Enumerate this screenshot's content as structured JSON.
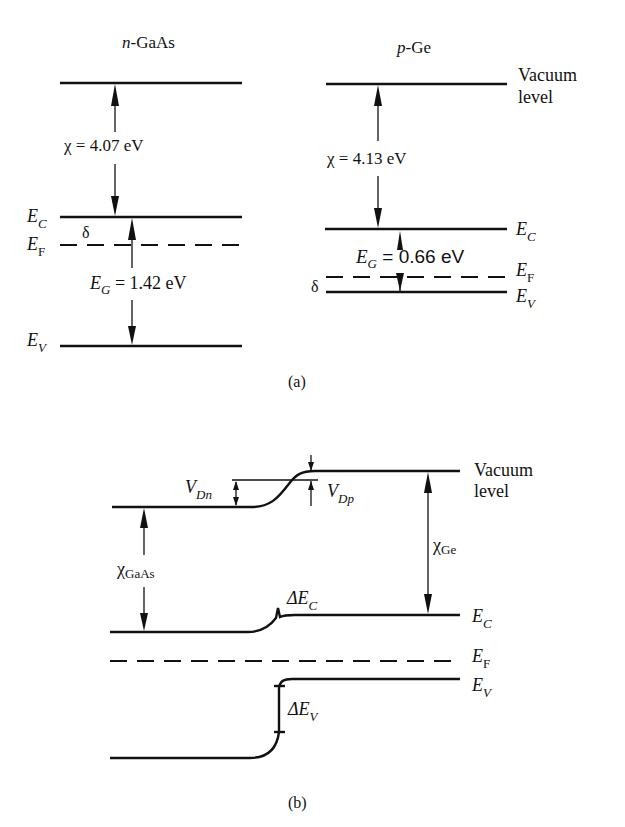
{
  "panel_a": {
    "caption": "(a)",
    "gaas": {
      "title_italic": "n",
      "title_rest": "-GaAs",
      "chi_label": "χ = 4.07 eV",
      "eg_sym": "E",
      "eg_sub": "G",
      "eg_value": " = 1.42 eV",
      "delta": "δ",
      "ec_sym": "E",
      "ec_sub": "C",
      "ef_sym": "E",
      "ef_sub": "F",
      "ev_sym": "E",
      "ev_sub": "V"
    },
    "ge": {
      "title_italic": "p",
      "title_rest": "-Ge",
      "chi_label": "χ = 4.13 eV",
      "eg_sym": "E",
      "eg_sub": "G",
      "eg_value": " = 0.66 eV",
      "delta": "δ",
      "vacuum_line1": "Vacuum",
      "vacuum_line2": "level",
      "ec_sym": "E",
      "ec_sub": "C",
      "ef_sym": "E",
      "ef_sub": "F",
      "ev_sym": "E",
      "ev_sub": "V"
    }
  },
  "panel_b": {
    "caption": "(b)",
    "vdn_sym": "V",
    "vdn_sub": "Dn",
    "vdp_sym": "V",
    "vdp_sub": "Dp",
    "chi_gaas_sym": "χ",
    "chi_gaas_sub": "GaAs",
    "chi_ge_sym": "χ",
    "chi_ge_sub": "Ge",
    "dec_sym": "ΔE",
    "dec_sub": "C",
    "dev_sym": "ΔE",
    "dev_sub": "V",
    "vacuum_line1": "Vacuum",
    "vacuum_line2": "level",
    "ec_sym": "E",
    "ec_sub": "C",
    "ef_sym": "E",
    "ef_sub": "F",
    "ev_sym": "E",
    "ev_sub": "V"
  }
}
